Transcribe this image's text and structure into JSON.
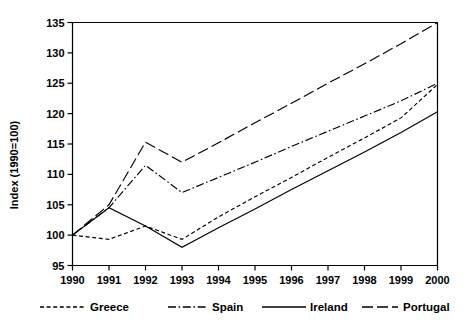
{
  "chart_data": {
    "type": "line",
    "title": "",
    "subtitle": "",
    "xlabel": "",
    "ylabel": "Index (1990=100)",
    "x": [
      1990,
      1991,
      1992,
      1993,
      1994,
      1995,
      1996,
      1997,
      1998,
      1999,
      2000
    ],
    "xtick_labels": [
      "1990",
      "1991",
      "1992",
      "1993",
      "1994",
      "1995",
      "1996",
      "1997",
      "1998",
      "1999",
      "2000"
    ],
    "ytick_labels": [
      "95",
      "100",
      "105",
      "110",
      "115",
      "120",
      "125",
      "130",
      "135"
    ],
    "yticks": [
      95,
      100,
      105,
      110,
      115,
      120,
      125,
      130,
      135
    ],
    "xlim": [
      1990,
      2000
    ],
    "ylim": [
      95,
      135
    ],
    "grid": false,
    "legend_position": "bottom",
    "series": [
      {
        "name": "Greece",
        "style": "dotted",
        "values": [
          100.0,
          99.3,
          101.5,
          99.3,
          103.0,
          106.3,
          109.5,
          112.8,
          116.0,
          119.3,
          124.8
        ]
      },
      {
        "name": "Spain",
        "style": "dash-dot",
        "values": [
          100.0,
          104.5,
          111.5,
          107.0,
          109.5,
          112.0,
          114.6,
          117.1,
          119.6,
          122.1,
          125.0
        ]
      },
      {
        "name": "Ireland",
        "style": "solid",
        "values": [
          100.0,
          104.5,
          101.5,
          98.0,
          101.2,
          104.3,
          107.5,
          110.6,
          113.7,
          116.9,
          120.3
        ]
      },
      {
        "name": "Portugal",
        "style": "long-dash",
        "values": [
          100.0,
          105.0,
          115.3,
          112.0,
          115.2,
          118.5,
          121.7,
          125.0,
          128.2,
          131.5,
          135.0
        ]
      }
    ]
  },
  "legend": {
    "items": [
      {
        "label": "Greece",
        "style": "dotted"
      },
      {
        "label": "Spain",
        "style": "dash-dot"
      },
      {
        "label": "Ireland",
        "style": "solid"
      },
      {
        "label": "Portugal",
        "style": "long-dash"
      }
    ]
  },
  "colors": {
    "ink": "#000000",
    "background": "#ffffff"
  }
}
